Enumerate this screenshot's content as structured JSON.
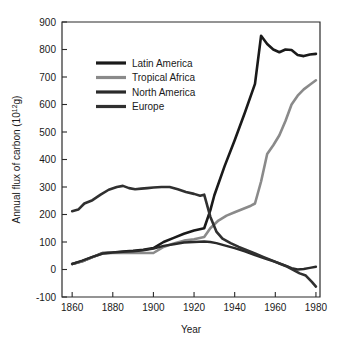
{
  "chart_data": {
    "type": "line",
    "title": "",
    "xlabel": "Year",
    "ylabel": "Annual flux of carbon (10¹²g)",
    "ylabel_parts": {
      "main": "Annual flux of carbon (10",
      "exponent": "12",
      "tail": "g)"
    },
    "xlim": [
      1855,
      1982
    ],
    "ylim": [
      -100,
      900
    ],
    "grid": false,
    "legend_position": "upper-left-inside",
    "x_ticks": [
      1860,
      1880,
      1900,
      1920,
      1940,
      1960,
      1980
    ],
    "x_tick_labels": [
      "1860",
      "1880",
      "1900",
      "1920",
      "1940",
      "1960",
      "1980"
    ],
    "y_ticks": [
      -100,
      0,
      100,
      200,
      300,
      400,
      500,
      600,
      700,
      800,
      900
    ],
    "y_tick_labels": [
      "-100",
      "0",
      "100",
      "200",
      "300",
      "400",
      "500",
      "600",
      "700",
      "800",
      "900"
    ],
    "series": [
      {
        "name": "Latin America",
        "color": "#1a1a1a",
        "width": 2.6,
        "x": [
          1860,
          1865,
          1870,
          1875,
          1880,
          1885,
          1890,
          1895,
          1900,
          1905,
          1910,
          1915,
          1920,
          1925,
          1928,
          1930,
          1935,
          1940,
          1945,
          1950,
          1953,
          1956,
          1959,
          1962,
          1965,
          1968,
          1971,
          1974,
          1977,
          1980
        ],
        "values": [
          20,
          30,
          45,
          60,
          62,
          65,
          68,
          72,
          78,
          100,
          115,
          130,
          142,
          150,
          215,
          270,
          375,
          470,
          570,
          675,
          850,
          820,
          800,
          790,
          800,
          798,
          780,
          776,
          782,
          784
        ]
      },
      {
        "name": "Tropical Africa",
        "color": "#8a8a8a",
        "width": 2.6,
        "x": [
          1860,
          1865,
          1870,
          1875,
          1880,
          1885,
          1890,
          1895,
          1900,
          1905,
          1910,
          1915,
          1920,
          1925,
          1928,
          1932,
          1936,
          1940,
          1944,
          1948,
          1950,
          1953,
          1956,
          1959,
          1962,
          1965,
          1968,
          1971,
          1974,
          1977,
          1980
        ],
        "values": [
          20,
          30,
          45,
          58,
          60,
          60,
          60,
          60,
          60,
          82,
          95,
          105,
          110,
          118,
          150,
          178,
          196,
          208,
          220,
          232,
          240,
          320,
          420,
          452,
          488,
          540,
          600,
          632,
          655,
          672,
          688
        ]
      },
      {
        "name": "North America",
        "color": "#2a2a2a",
        "width": 2.4,
        "x": [
          1860,
          1865,
          1870,
          1875,
          1880,
          1885,
          1890,
          1895,
          1900,
          1905,
          1910,
          1915,
          1920,
          1925,
          1928,
          1931,
          1935,
          1940,
          1945,
          1950,
          1955,
          1960,
          1965,
          1968,
          1971,
          1974,
          1977,
          1980
        ],
        "values": [
          20,
          32,
          46,
          58,
          62,
          64,
          66,
          70,
          76,
          86,
          92,
          98,
          100,
          102,
          100,
          96,
          88,
          78,
          66,
          52,
          40,
          28,
          14,
          5,
          0,
          2,
          6,
          10
        ]
      },
      {
        "name": "Europe",
        "color": "#303030",
        "width": 2.6,
        "x": [
          1860,
          1863,
          1866,
          1870,
          1874,
          1878,
          1882,
          1885,
          1888,
          1891,
          1894,
          1897,
          1900,
          1904,
          1908,
          1912,
          1916,
          1920,
          1923,
          1925,
          1928,
          1931,
          1934,
          1938,
          1942,
          1946,
          1950,
          1954,
          1958,
          1962,
          1966,
          1969,
          1972,
          1975,
          1978,
          1980
        ],
        "values": [
          212,
          218,
          240,
          252,
          272,
          290,
          300,
          304,
          296,
          292,
          294,
          296,
          298,
          300,
          300,
          292,
          282,
          275,
          268,
          272,
          192,
          138,
          112,
          96,
          82,
          70,
          58,
          46,
          34,
          22,
          10,
          -2,
          -14,
          -22,
          -45,
          -62
        ]
      }
    ],
    "legend": [
      {
        "label": "Latin America",
        "color": "#1a1a1a"
      },
      {
        "label": "Tropical Africa",
        "color": "#8a8a8a"
      },
      {
        "label": "North America",
        "color": "#2a2a2a"
      },
      {
        "label": "Europe",
        "color": "#303030"
      }
    ]
  }
}
